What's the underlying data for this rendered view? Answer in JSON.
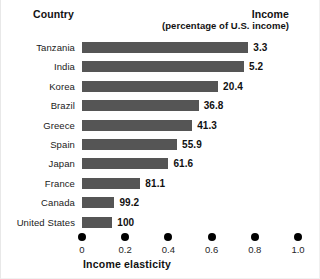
{
  "header": {
    "country_label": "Country",
    "income_label": "Income",
    "income_sublabel": "(percentage of U.S. income)"
  },
  "axis": {
    "title": "Income elasticity",
    "tick_labels": [
      "0",
      "0.2",
      "0.4",
      "0.6",
      "0.8",
      "1.0"
    ]
  },
  "colors": {
    "bar": "#555555",
    "text": "#111111",
    "tick": "#000000",
    "background": "#ffffff"
  },
  "chart_data": {
    "type": "bar",
    "orientation": "horizontal",
    "title": "",
    "subtitle": "",
    "xlabel": "Income elasticity",
    "ylabel": "Country",
    "xlim": [
      0,
      1.0
    ],
    "xticks": [
      0,
      0.2,
      0.4,
      0.6,
      0.8,
      1.0
    ],
    "grid": false,
    "legend": null,
    "categories": [
      "Tanzania",
      "India",
      "Korea",
      "Brazil",
      "Greece",
      "Spain",
      "Japan",
      "France",
      "Canada",
      "United States"
    ],
    "values": [
      0.77,
      0.75,
      0.63,
      0.54,
      0.51,
      0.44,
      0.4,
      0.27,
      0.15,
      0.14
    ],
    "data_labels": [
      "3.3",
      "5.2",
      "20.4",
      "36.8",
      "41.3",
      "55.9",
      "61.6",
      "81.1",
      "99.2",
      "100"
    ],
    "data_label_header": "Income (percentage of U.S. income)",
    "rows": [
      {
        "country": "Tanzania",
        "elasticity": 0.77,
        "income_pct": "3.3"
      },
      {
        "country": "India",
        "elasticity": 0.75,
        "income_pct": "5.2"
      },
      {
        "country": "Korea",
        "elasticity": 0.63,
        "income_pct": "20.4"
      },
      {
        "country": "Brazil",
        "elasticity": 0.54,
        "income_pct": "36.8"
      },
      {
        "country": "Greece",
        "elasticity": 0.51,
        "income_pct": "41.3"
      },
      {
        "country": "Spain",
        "elasticity": 0.44,
        "income_pct": "55.9"
      },
      {
        "country": "Japan",
        "elasticity": 0.4,
        "income_pct": "61.6"
      },
      {
        "country": "France",
        "elasticity": 0.27,
        "income_pct": "81.1"
      },
      {
        "country": "Canada",
        "elasticity": 0.15,
        "income_pct": "99.2"
      },
      {
        "country": "United States",
        "elasticity": 0.14,
        "income_pct": "100"
      }
    ]
  }
}
